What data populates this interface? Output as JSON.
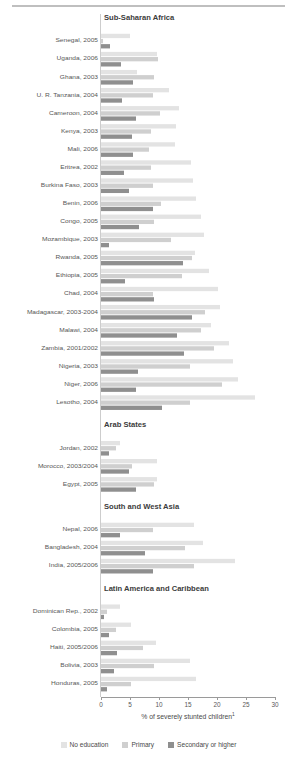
{
  "chart_data": {
    "type": "bar",
    "orientation": "horizontal",
    "title": "",
    "xlabel": "% of severely stunted children¹",
    "ylabel": "",
    "xlim": [
      0,
      30
    ],
    "xticks": [
      0,
      5,
      10,
      15,
      20,
      25,
      30
    ],
    "grid": false,
    "legend_position": "bottom",
    "series": [
      {
        "name": "No education",
        "color": "#e3e3e3"
      },
      {
        "name": "Primary",
        "color": "#cfcfcf"
      },
      {
        "name": "Secondary or higher",
        "color": "#8f8f8f"
      }
    ],
    "sections": [
      {
        "label": "Sub-Saharan Africa",
        "rows": [
          {
            "category": "Senegal, 2005",
            "values": [
              5.0,
              0.4,
              1.6
            ]
          },
          {
            "category": "Uganda, 2006",
            "values": [
              9.6,
              9.8,
              3.4
            ]
          },
          {
            "category": "Ghana, 2003",
            "values": [
              6.2,
              9.1,
              5.6
            ]
          },
          {
            "category": "U. R. Tanzania, 2004",
            "values": [
              11.7,
              8.9,
              3.6
            ]
          },
          {
            "category": "Cameroon, 2004",
            "values": [
              13.5,
              10.2,
              6.1
            ]
          },
          {
            "category": "Kenya, 2003",
            "values": [
              12.9,
              8.6,
              5.4
            ]
          },
          {
            "category": "Mali, 2006",
            "values": [
              12.8,
              8.2,
              5.5
            ]
          },
          {
            "category": "Eritrea, 2002",
            "values": [
              15.6,
              8.6,
              3.9
            ]
          },
          {
            "category": "Burkina Faso, 2003",
            "values": [
              15.9,
              9.0,
              4.9
            ]
          },
          {
            "category": "Benin, 2006",
            "values": [
              16.3,
              10.4,
              9.0
            ]
          },
          {
            "category": "Congo, 2005",
            "values": [
              17.3,
              9.1,
              6.6
            ]
          },
          {
            "category": "Mozambique, 2003",
            "values": [
              17.8,
              12.0,
              1.4
            ]
          },
          {
            "category": "Rwanda, 2005",
            "values": [
              16.2,
              15.7,
              14.2
            ]
          },
          {
            "category": "Ethiopia, 2005",
            "values": [
              18.6,
              14.0,
              4.1
            ]
          },
          {
            "category": "Chad, 2004",
            "values": [
              20.1,
              9.0,
              9.2
            ]
          },
          {
            "category": "Madagascar, 2003-2004",
            "values": [
              20.6,
              18.0,
              15.7
            ]
          },
          {
            "category": "Malawi, 2004",
            "values": [
              18.9,
              17.3,
              13.1
            ]
          },
          {
            "category": "Zambia, 2001/2002",
            "values": [
              22.1,
              19.5,
              14.3
            ]
          },
          {
            "category": "Nigeria, 2003",
            "values": [
              22.8,
              15.4,
              6.4
            ]
          },
          {
            "category": "Niger, 2006",
            "values": [
              23.6,
              20.8,
              6.1
            ]
          },
          {
            "category": "Lesotho, 2004",
            "values": [
              26.6,
              15.3,
              10.6
            ]
          }
        ]
      },
      {
        "label": "Arab States",
        "rows": [
          {
            "category": "Jordan, 2002",
            "values": [
              3.3,
              2.5,
              1.3
            ]
          },
          {
            "category": "Morocco, 2003/2004",
            "values": [
              9.6,
              5.3,
              4.8
            ]
          },
          {
            "category": "Egypt, 2005",
            "values": [
              9.7,
              9.1,
              6.1
            ]
          }
        ]
      },
      {
        "label": "South and West Asia",
        "rows": [
          {
            "category": "Nepal, 2006",
            "values": [
              16.0,
              8.9,
              3.2
            ]
          },
          {
            "category": "Bangladesh, 2004",
            "values": [
              17.5,
              14.4,
              7.6
            ]
          },
          {
            "category": "India, 2005/2006",
            "values": [
              23.1,
              16.1,
              8.9
            ]
          }
        ]
      },
      {
        "label": "Latin America and Caribbean",
        "rows": [
          {
            "category": "Dominican Rep., 2002",
            "values": [
              3.2,
              1.0,
              0.5
            ]
          },
          {
            "category": "Colombia, 2005",
            "values": [
              5.2,
              2.6,
              1.3
            ]
          },
          {
            "category": "Haiti, 2005/2006",
            "values": [
              9.4,
              7.2,
              2.7
            ]
          },
          {
            "category": "Bolivia, 2003",
            "values": [
              15.4,
              9.1,
              2.3
            ]
          },
          {
            "category": "Honduras, 2005",
            "values": [
              16.3,
              5.1,
              1.1
            ]
          }
        ]
      }
    ]
  }
}
